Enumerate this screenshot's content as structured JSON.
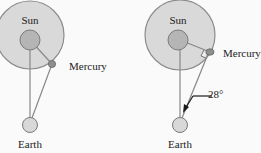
{
  "colors": {
    "background": "#fafafa",
    "orbit_fill": "#d9d9d9",
    "orbit_stroke": "#8c8c8c",
    "sun_fill": "#b5b5b5",
    "sun_stroke": "#7a7a7a",
    "mercury_fill": "#8f8f8f",
    "earth_fill": "#d8d8d8",
    "line": "#888888",
    "arrow": "#1a1a1a",
    "text": "#222222"
  },
  "left_panel": {
    "labels": {
      "sun": "Sun",
      "mercury": "Mercury",
      "earth": "Earth"
    }
  },
  "right_panel": {
    "labels": {
      "sun": "Sun",
      "mercury": "Mercury",
      "earth": "Earth",
      "angle": "28°"
    },
    "angle_value_deg": 28,
    "right_angle_marker": true
  }
}
